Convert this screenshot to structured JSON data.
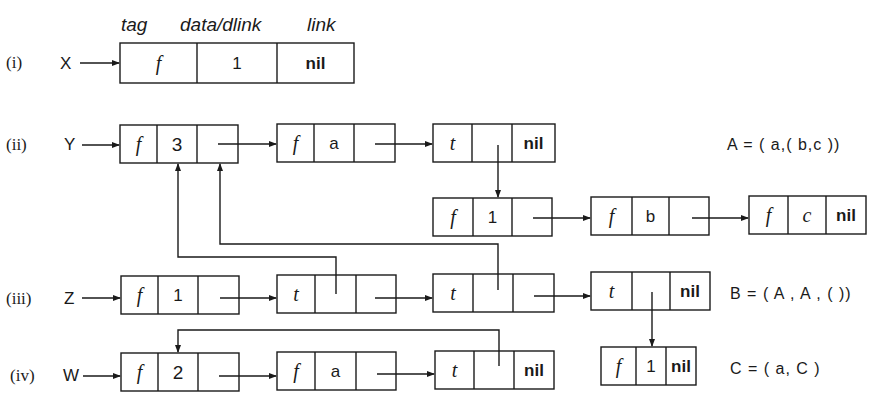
{
  "figure": {
    "header": {
      "tag": "tag",
      "data": "data/dlink",
      "link": "link"
    },
    "rows": [
      {
        "label": "(i)",
        "pointer": "X"
      },
      {
        "label": "(ii)",
        "pointer": "Y"
      },
      {
        "label": "(iii)",
        "pointer": "Z"
      },
      {
        "label": "(iv)",
        "pointer": "W"
      }
    ],
    "nodes": {
      "x1": [
        "f",
        "1",
        "nil"
      ],
      "y1": [
        "f",
        "3",
        ""
      ],
      "y2": [
        "f",
        "a",
        ""
      ],
      "y3": [
        "t",
        "",
        "nil"
      ],
      "y4": [
        "f",
        "1",
        ""
      ],
      "y5": [
        "f",
        "b",
        ""
      ],
      "y6": [
        "f",
        "c",
        "nil"
      ],
      "z1": [
        "f",
        "1",
        ""
      ],
      "z2": [
        "t",
        "",
        ""
      ],
      "z3": [
        "t",
        "",
        ""
      ],
      "z4": [
        "t",
        "",
        "nil"
      ],
      "w1": [
        "f",
        "2",
        ""
      ],
      "w2": [
        "f",
        "a",
        ""
      ],
      "w3": [
        "t",
        "",
        "nil"
      ],
      "c1": [
        "f",
        "1",
        "nil"
      ]
    },
    "equations": {
      "A": "A = ( a,( b,c ))",
      "B": "B = ( A , A , ( ))",
      "C": "C = ( a, C )"
    }
  }
}
